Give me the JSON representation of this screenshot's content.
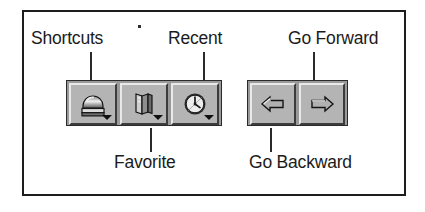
{
  "figure": {
    "kind": "toolbar-callout-diagram",
    "background_color": "#ffffff",
    "frame_color": "#1d1d1d"
  },
  "callouts": [
    {
      "id": "shortcuts",
      "label": "Shortcuts",
      "position": "above",
      "points_to": "shortcuts-button"
    },
    {
      "id": "recent",
      "label": "Recent",
      "position": "above",
      "points_to": "recent-button"
    },
    {
      "id": "go-forward",
      "label": "Go Forward",
      "position": "above",
      "points_to": "go-forward-button"
    },
    {
      "id": "favorite",
      "label": "Favorite",
      "position": "below",
      "points_to": "favorite-button"
    },
    {
      "id": "go-backward",
      "label": "Go Backward",
      "position": "below",
      "points_to": "go-backward-button"
    }
  ],
  "toolbars": [
    {
      "id": "navigation-shortcuts-toolbar",
      "buttons": [
        {
          "id": "shortcuts-button",
          "icon": "shortcuts-icon",
          "tooltip": "Shortcuts",
          "has_dropdown": true
        },
        {
          "id": "favorite-button",
          "icon": "book-icon",
          "tooltip": "Favorite",
          "has_dropdown": true
        },
        {
          "id": "recent-button",
          "icon": "clock-icon",
          "tooltip": "Recent",
          "has_dropdown": true
        }
      ]
    },
    {
      "id": "navigation-arrows-toolbar",
      "buttons": [
        {
          "id": "go-backward-button",
          "icon": "arrow-left-icon",
          "tooltip": "Go Backward",
          "has_dropdown": false
        },
        {
          "id": "go-forward-button",
          "icon": "arrow-right-icon",
          "tooltip": "Go Forward",
          "has_dropdown": false
        }
      ]
    }
  ],
  "colors": {
    "toolbar_background": "#9a9a9a",
    "button_face": "#b4b4b4",
    "button_highlight": "#e9e9e9",
    "button_shadow": "#3c3c3c",
    "ink": "#1b1b1b"
  }
}
